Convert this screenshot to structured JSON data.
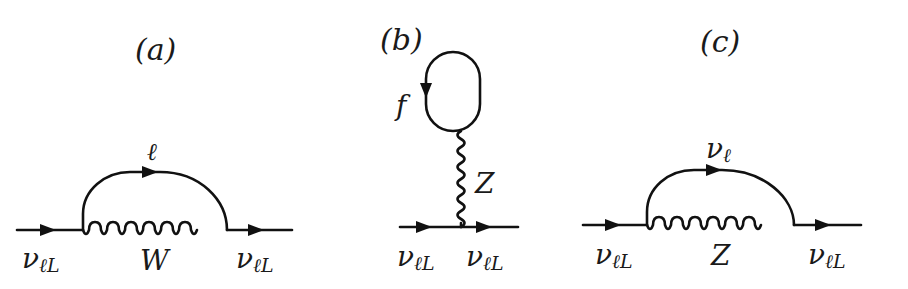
{
  "figure": {
    "panels": [
      {
        "id": "a",
        "title": "(a)",
        "boson": "W",
        "loop_fermion": "ℓ",
        "incoming": "ν",
        "incoming_sub": "ℓL",
        "outgoing": "ν",
        "outgoing_sub": "ℓL"
      },
      {
        "id": "b",
        "title": "(b)",
        "boson": "Z",
        "loop_fermion": "f",
        "incoming": "ν",
        "incoming_sub": "ℓL",
        "outgoing": "ν",
        "outgoing_sub": "ℓL"
      },
      {
        "id": "c",
        "title": "(c)",
        "boson": "Z",
        "loop_fermion": "ν",
        "loop_fermion_sub": "ℓ",
        "incoming": "ν",
        "incoming_sub": "ℓL",
        "outgoing": "ν",
        "outgoing_sub": "ℓL"
      }
    ]
  }
}
